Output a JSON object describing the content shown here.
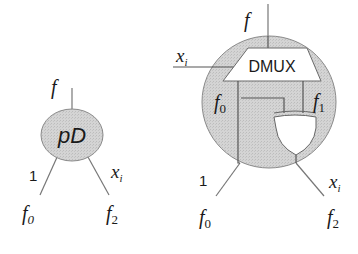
{
  "diagram": {
    "colors": {
      "node_fill": "#d2d2d2",
      "node_stroke": "#8a8a8a",
      "wire": "#777777",
      "text": "#1a1a1a",
      "gate_fill": "#ffffff"
    },
    "left_node": {
      "label": "pD",
      "top_output": "f",
      "left_edge_label": "1",
      "right_edge_label": "x",
      "right_edge_label_sub": "i",
      "left_child": "f",
      "left_child_sub": "0",
      "right_child": "f",
      "right_child_sub": "2"
    },
    "right_node": {
      "top_output": "f",
      "select_input": "x",
      "select_input_sub": "i",
      "dmux_label": "DMUX",
      "dmux_out0": "f",
      "dmux_out0_sub": "0",
      "dmux_out1": "f",
      "dmux_out1_sub": "1",
      "gate": "xor-gate",
      "left_edge_label": "1",
      "right_edge_label": "x",
      "right_edge_label_sub": "i",
      "left_child": "f",
      "left_child_sub": "0",
      "right_child": "f",
      "right_child_sub": "2"
    }
  }
}
